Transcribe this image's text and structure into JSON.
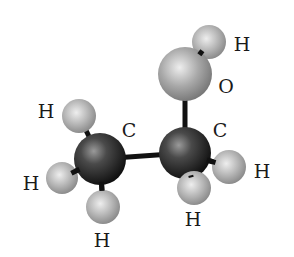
{
  "diagram": {
    "colors": {
      "carbon": "#1e1e1e",
      "carbon_highlight": "#8a8a8a",
      "oxygen": "#8c8c8c",
      "oxygen_highlight": "#e6e6e6",
      "hydrogen": "#9a9a9a",
      "hydrogen_highlight": "#e8e8e8",
      "bond": "#111111",
      "label": "#1a1a1a"
    },
    "atoms": [
      {
        "id": "C1",
        "element": "C",
        "label": "C",
        "cx": 100,
        "cy": 159,
        "r": 26,
        "label_x": 129,
        "label_y": 137
      },
      {
        "id": "C2",
        "element": "C",
        "label": "C",
        "cx": 185,
        "cy": 153,
        "r": 26,
        "label_x": 220,
        "label_y": 137
      },
      {
        "id": "O",
        "element": "O",
        "label": "O",
        "cx": 185,
        "cy": 74,
        "r": 27,
        "label_x": 226,
        "label_y": 93
      },
      {
        "id": "H_O",
        "element": "H",
        "label": "H",
        "cx": 209,
        "cy": 42,
        "r": 17,
        "label_x": 242,
        "label_y": 51
      },
      {
        "id": "H_C1a",
        "element": "H",
        "label": "H",
        "cx": 79,
        "cy": 116,
        "r": 17,
        "label_x": 46,
        "label_y": 118
      },
      {
        "id": "H_C1b",
        "element": "H",
        "label": "H",
        "cx": 62,
        "cy": 178,
        "r": 16,
        "label_x": 31,
        "label_y": 190
      },
      {
        "id": "H_C1c",
        "element": "H",
        "label": "H",
        "cx": 103,
        "cy": 207,
        "r": 17,
        "label_x": 102,
        "label_y": 247
      },
      {
        "id": "H_C2a",
        "element": "H",
        "label": "H",
        "cx": 229,
        "cy": 167,
        "r": 17,
        "label_x": 262,
        "label_y": 178
      },
      {
        "id": "H_C2b",
        "element": "H",
        "label": "H",
        "cx": 194,
        "cy": 188,
        "r": 17,
        "label_x": 193,
        "label_y": 226
      }
    ],
    "bonds": [
      {
        "from": "C1",
        "to": "C2"
      },
      {
        "from": "C2",
        "to": "O"
      },
      {
        "from": "O",
        "to": "H_O"
      },
      {
        "from": "C1",
        "to": "H_C1a"
      },
      {
        "from": "C1",
        "to": "H_C1b"
      },
      {
        "from": "C1",
        "to": "H_C1c"
      },
      {
        "from": "C2",
        "to": "H_C2a"
      },
      {
        "from": "C2",
        "to": "H_C2b"
      }
    ]
  }
}
